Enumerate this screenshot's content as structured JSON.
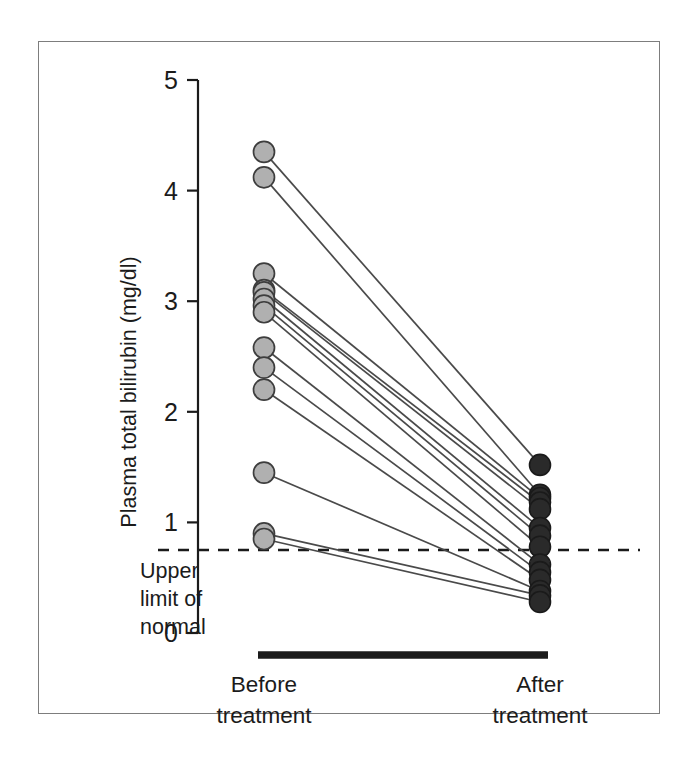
{
  "figure": {
    "background_color": "#ffffff",
    "frame_color": "#7d7d7d"
  },
  "chart_data": {
    "type": "line",
    "subtype": "paired-slopegraph",
    "title": "",
    "xlabel": "",
    "ylabel": "Plasma total bilirubin (mg/dl)",
    "categories": [
      "Before treatment",
      "After treatment"
    ],
    "category_labels_wrapped": [
      [
        "Before",
        "treatment"
      ],
      [
        "After",
        "treatment"
      ]
    ],
    "ylim": [
      0,
      5
    ],
    "yticks": [
      0,
      1,
      2,
      3,
      4,
      5
    ],
    "ytick_labels": [
      "0",
      "1",
      "2",
      "3",
      "4",
      "5"
    ],
    "grid": false,
    "legend": false,
    "legend_position": "none",
    "series_colors": {
      "before_marker_fill": "#b0b0b0",
      "before_marker_edge": "#3d3d3d",
      "after_marker_fill": "#2a2a2a",
      "after_marker_edge": "#1a1a1a",
      "connector_line": "#4a4a4a",
      "reference_line": "#1b1b1b",
      "axis": "#1b1b1b",
      "category_bar": "#1b1b1b"
    },
    "reference_line": {
      "label": "Upper limit of normal",
      "label_lines": [
        "Upper",
        "limit of",
        "normal"
      ],
      "value": 0.75,
      "style": "dashed"
    },
    "n_pairs": 14,
    "pairs": [
      {
        "id": 1,
        "before": 4.35,
        "after": 1.52
      },
      {
        "id": 2,
        "before": 4.12,
        "after": 1.25
      },
      {
        "id": 3,
        "before": 3.25,
        "after": 1.22
      },
      {
        "id": 4,
        "before": 3.1,
        "after": 1.18
      },
      {
        "id": 5,
        "before": 3.08,
        "after": 1.12
      },
      {
        "id": 6,
        "before": 3.02,
        "after": 0.95
      },
      {
        "id": 7,
        "before": 2.96,
        "after": 0.88
      },
      {
        "id": 8,
        "before": 2.9,
        "after": 0.78
      },
      {
        "id": 9,
        "before": 2.58,
        "after": 0.62
      },
      {
        "id": 10,
        "before": 2.4,
        "after": 0.55
      },
      {
        "id": 11,
        "before": 2.2,
        "after": 0.48
      },
      {
        "id": 12,
        "before": 1.45,
        "after": 0.38
      },
      {
        "id": 13,
        "before": 0.9,
        "after": 0.34
      },
      {
        "id": 14,
        "before": 0.85,
        "after": 0.28
      }
    ]
  }
}
